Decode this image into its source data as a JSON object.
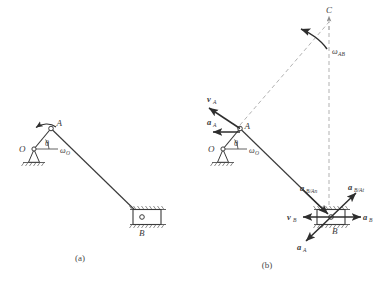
{
  "figure": {
    "title_visible": false,
    "background_color": "#ffffff",
    "line_color": "#3a3a3a",
    "dash_color": "#a8a8a8",
    "vector_color": "#2e2e2e",
    "panels": [
      {
        "caption": "(a)",
        "description": "slider-crank mechanism configuration",
        "points": [
          {
            "name": "O",
            "label": "O"
          },
          {
            "name": "A",
            "label": "A"
          },
          {
            "name": "B",
            "label": "B"
          }
        ],
        "angles": [
          {
            "name": "theta",
            "label": "θ"
          }
        ],
        "omegas": [
          {
            "name": "omega-O",
            "base": "ω",
            "sub": "O"
          }
        ]
      },
      {
        "caption": "(b)",
        "description": "velocity and acceleration vector analysis with instant center C",
        "points": [
          {
            "name": "O",
            "label": "O"
          },
          {
            "name": "A",
            "label": "A"
          },
          {
            "name": "B",
            "label": "B"
          },
          {
            "name": "C",
            "label": "C"
          }
        ],
        "angles": [
          {
            "name": "theta",
            "label": "θ"
          }
        ],
        "omegas": [
          {
            "name": "omega-O",
            "base": "ω",
            "sub": "O"
          },
          {
            "name": "omega-AB",
            "base": "ω",
            "sub": "AB"
          }
        ],
        "vectors": [
          {
            "name": "v-A",
            "base": "v",
            "sub": "A",
            "kind": "velocity"
          },
          {
            "name": "a-A-at-A",
            "base": "a",
            "sub": "A",
            "kind": "acceleration"
          },
          {
            "name": "v-B",
            "base": "v",
            "sub": "B",
            "kind": "velocity"
          },
          {
            "name": "a-B",
            "base": "a",
            "sub": "B",
            "kind": "acceleration"
          },
          {
            "name": "a-A-at-B",
            "base": "a",
            "sub": "A",
            "kind": "acceleration"
          },
          {
            "name": "a-BA-n",
            "base": "a",
            "sub": "B/An",
            "kind": "acceleration"
          },
          {
            "name": "a-BA-t",
            "base": "a",
            "sub": "B/At",
            "kind": "acceleration"
          }
        ]
      }
    ]
  }
}
